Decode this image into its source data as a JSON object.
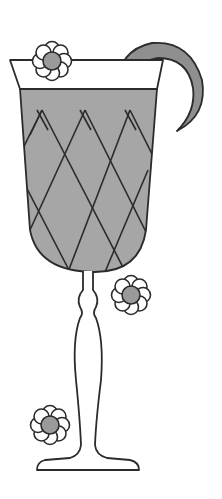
{
  "illustration": {
    "title": "Cocktail glass with lemon peel and flowers",
    "colors": {
      "background": "#ffffff",
      "outline": "#2b2b2b",
      "liquid": "#a6a6a6",
      "garnish": "#8f8f8f",
      "flower_petal": "#ffffff",
      "flower_center": "#9a9a9a"
    },
    "elements": {
      "glass": "cocktail-glass",
      "liquid": "grey-liquid-with-diamond-pattern",
      "garnish": "crescent-lemon-peel",
      "flowers": [
        {
          "name": "flower-top-left",
          "cx": 52,
          "cy": 61
        },
        {
          "name": "flower-middle-right",
          "cx": 131,
          "cy": 295
        },
        {
          "name": "flower-bottom-left",
          "cx": 50,
          "cy": 425
        }
      ]
    }
  }
}
